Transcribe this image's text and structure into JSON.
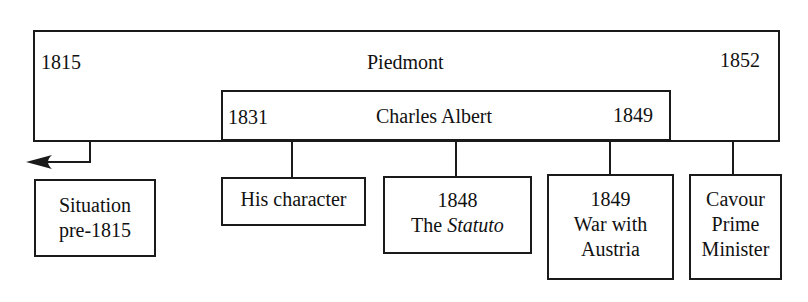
{
  "outer": {
    "label": "Piedmont",
    "start_year": "1815",
    "end_year": "1852"
  },
  "inner": {
    "label": "Charles Albert",
    "start_year": "1831",
    "end_year": "1849"
  },
  "nodes": [
    {
      "lines": [
        "Situation",
        "pre-1815"
      ]
    },
    {
      "lines": [
        "His character"
      ]
    },
    {
      "lines": [
        "1848"
      ],
      "prefix": "The ",
      "italic": "Statuto"
    },
    {
      "lines": [
        "1849",
        "War with",
        "Austria"
      ]
    },
    {
      "lines": [
        "Cavour",
        "Prime",
        "Minister"
      ]
    }
  ],
  "arrow": {
    "direction": "left",
    "icon": "arrow-left-icon"
  }
}
